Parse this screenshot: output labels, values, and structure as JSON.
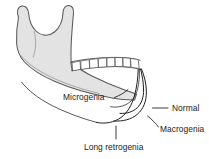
{
  "figure": {
    "background_color": "#ffffff",
    "bone_fill_color": "#e3e3e3",
    "bone_outline_color": "#5a5a5a",
    "tooth_fill_color": "#ffffff",
    "contour_color": "#1f1f1f",
    "label_color": "#1a1a1a"
  },
  "labels": {
    "microgenia": "Microgenia",
    "normal": "Normal",
    "macrogenia": "Macrogenia",
    "long_retrogenia": "Long retrogenia"
  },
  "anatomy": {
    "ramus": "mandibular-ramus",
    "coronoid_process": "coronoid-process",
    "condyle": "condylar-process",
    "sigmoid_notch": "sigmoid-notch",
    "gonial_angle": "gonial-angle",
    "body": "mandibular-body",
    "symphysis": "mandibular-symphysis",
    "tooth_count": 8
  }
}
